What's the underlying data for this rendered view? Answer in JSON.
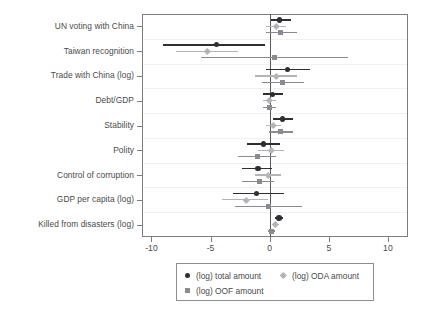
{
  "chart_data": {
    "type": "scatter",
    "subtype": "coefficient-forest-plot",
    "title": "",
    "xlabel": "",
    "ylabel": "",
    "xlim": [
      -10.8,
      11.7
    ],
    "ylim_categories_top_to_bottom": true,
    "grid": "horizontal-light",
    "legend_position": "bottom-outside",
    "zero_reference_line": 0,
    "xticks": [
      -10,
      -5,
      0,
      5,
      10
    ],
    "xticklabels": [
      "-10",
      "-5",
      "0",
      "5",
      "10"
    ],
    "categories": [
      "UN voting with China",
      "Taiwan recognition",
      "Trade with China (log)",
      "Debt/GDP",
      "Stability",
      "Polity",
      "Control of corruption",
      "GDP per capita (log)",
      "Killed from disasters (log)"
    ],
    "series": [
      {
        "name": "(log) total amount",
        "marker": "circle",
        "color": "#2f2f33",
        "estimates": [
          0.85,
          -4.5,
          1.5,
          0.25,
          1.1,
          -0.5,
          -1.0,
          -1.1,
          0.8
        ],
        "ci_low": [
          0.1,
          -9.0,
          -0.3,
          -0.55,
          0.3,
          -1.9,
          -2.3,
          -3.1,
          0.45
        ],
        "ci_high": [
          1.8,
          -0.4,
          3.4,
          1.1,
          2.0,
          0.9,
          0.2,
          1.2,
          1.15
        ]
      },
      {
        "name": "(log) ODA amount",
        "marker": "diamond",
        "color": "#b3b3b8",
        "estimates": [
          0.55,
          -5.3,
          0.6,
          -0.05,
          0.3,
          0.1,
          -0.1,
          -2.0,
          0.5
        ],
        "ci_low": [
          -0.35,
          -7.9,
          -1.2,
          -0.6,
          -0.3,
          -1.0,
          -1.2,
          -4.0,
          0.2
        ],
        "ci_high": [
          1.4,
          -2.7,
          2.3,
          0.55,
          0.95,
          1.25,
          0.95,
          -0.1,
          0.8
        ]
      },
      {
        "name": "(log) OOF amount",
        "marker": "square",
        "color": "#8a8a90",
        "estimates": [
          0.9,
          0.4,
          1.05,
          -0.05,
          0.95,
          -1.0,
          -0.9,
          -0.1,
          0.15
        ],
        "ci_low": [
          -0.35,
          -5.8,
          -0.65,
          -0.55,
          -0.05,
          -2.7,
          -2.3,
          -2.9,
          -0.15
        ],
        "ci_high": [
          2.3,
          6.6,
          2.9,
          0.5,
          2.0,
          0.55,
          0.35,
          2.7,
          0.45
        ]
      }
    ]
  },
  "legend": {
    "entries": [
      {
        "label": "(log) total amount",
        "marker": "circle-marker-icon"
      },
      {
        "label": "(log) ODA amount",
        "marker": "diamond-marker-icon"
      },
      {
        "label": "(log) OOF amount",
        "marker": "square-marker-icon"
      }
    ]
  },
  "colors": {
    "total_amount": "#2f2f33",
    "oda_amount": "#b3b3b8",
    "oof_amount": "#8a8a90",
    "frame": "#7d7d7d",
    "gridline": "#f0f0f2",
    "zero_line": "#5a5a5a",
    "text": "#4a4a4a",
    "background": "#ffffff"
  }
}
